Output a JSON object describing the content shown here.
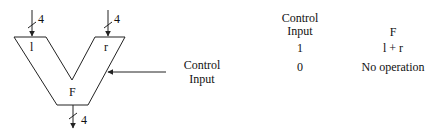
{
  "diagram": {
    "type": "adder block diagram",
    "inputs": [
      {
        "name": "l",
        "width_label": "4"
      },
      {
        "name": "r",
        "width_label": "4"
      }
    ],
    "output": {
      "name": "F",
      "width_label": "4"
    },
    "control_label_line1": "Control",
    "control_label_line2": "Input"
  },
  "table": {
    "header_ctl_line1": "Control",
    "header_ctl_line2": "Input",
    "header_f": "F",
    "rows": [
      {
        "control": "1",
        "f": "l + r"
      },
      {
        "control": "0",
        "f": "No operation"
      }
    ]
  },
  "colors": {
    "stroke": "#222222",
    "background": "#ffffff"
  }
}
